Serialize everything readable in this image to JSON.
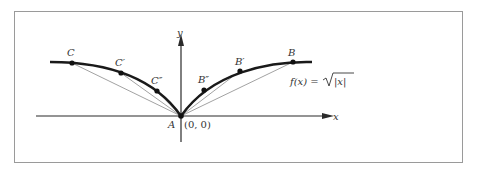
{
  "figure": {
    "function_label": "f(x) = √|x|",
    "function_label_parts": {
      "lhs": "f(x) = ",
      "radicand": "|x|"
    },
    "axes": {
      "x_label": "x",
      "y_label": "y"
    },
    "origin": {
      "name": "A",
      "coord_label": "(0, 0)"
    },
    "points": [
      {
        "name": "C",
        "label": "C"
      },
      {
        "name": "C'",
        "label": "C′"
      },
      {
        "name": "C''",
        "label": "C″"
      },
      {
        "name": "B''",
        "label": "B″"
      },
      {
        "name": "B'",
        "label": "B′"
      },
      {
        "name": "B",
        "label": "B"
      }
    ],
    "colors": {
      "curve": "#1a1a1a",
      "secants": "#8a8a8a",
      "frame": "#9a9a9a",
      "axes": "#2a2a2a"
    }
  }
}
